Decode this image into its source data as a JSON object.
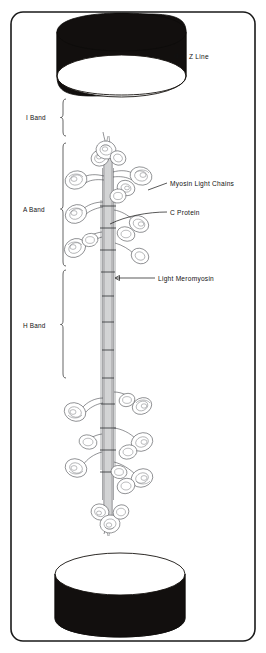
{
  "figure": {
    "border_color": "#1a1a1a",
    "background_color": "#ffffff",
    "ink_color": "#111111"
  },
  "structures": {
    "z_line_top": {
      "name": "z-line-disc-top",
      "fill": "#120f0e",
      "face": "#ffffff"
    },
    "z_line_bottom": {
      "name": "z-line-disc-bottom",
      "fill": "#120f0e",
      "face": "#ffffff"
    },
    "filament": {
      "name": "myosin-thick-filament",
      "shaft_color": "#5d5f63"
    }
  },
  "band_labels": [
    {
      "id": "i-band",
      "label": "I Band",
      "text_x": 26,
      "text_y": 117,
      "brace_x": 63,
      "brace_top": 97,
      "brace_bottom": 140
    },
    {
      "id": "a-band",
      "label": "A Band",
      "text_x": 23,
      "text_y": 211,
      "brace_x": 63,
      "brace_top": 142,
      "brace_bottom": 266
    },
    {
      "id": "h-band",
      "label": "H Band",
      "text_x": 23,
      "text_y": 327,
      "brace_x": 63,
      "brace_top": 268,
      "brace_bottom": 378
    }
  ],
  "feature_labels": [
    {
      "id": "z-line",
      "label": "Z Line",
      "text_x": 190,
      "text_y": 59,
      "leader": "M187,56 L176,56",
      "arrow": true
    },
    {
      "id": "myosin-light-chains",
      "label": "Myosin Light Chains",
      "text_x": 170,
      "text_y": 186,
      "leader": "M167,183 L146,190",
      "arrow": false
    },
    {
      "id": "c-protein",
      "label": "C Protein",
      "text_x": 170,
      "text_y": 215,
      "leader": "M167,212 C150,212 128,216 112,222",
      "arrow": false
    },
    {
      "id": "light-meromyosin",
      "label": "Light Meromyosin",
      "text_x": 158,
      "text_y": 281,
      "leader": "M155,278 L113,278",
      "arrow": true
    }
  ],
  "colors": {
    "ink": "#111111",
    "disc_dark": "#120f0e",
    "shaft_gray": "#5d5f63",
    "head_outline": "#4a4c50",
    "frame": "#1a1a1a"
  }
}
